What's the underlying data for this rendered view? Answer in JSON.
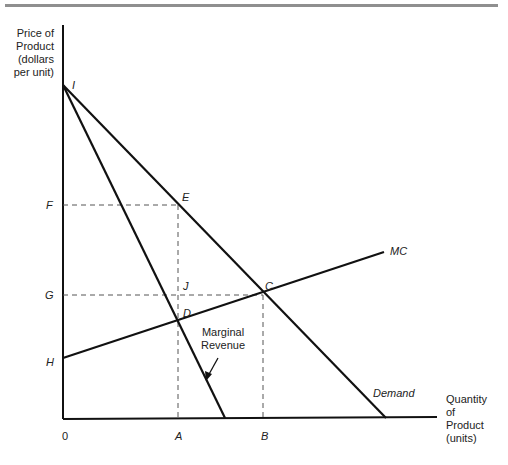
{
  "axes": {
    "y_label_lines": [
      "Price of",
      "Product",
      "(dollars",
      "per unit)"
    ],
    "x_label_lines": [
      "Quantity",
      "of",
      "Product",
      "(units)"
    ],
    "origin": "0"
  },
  "y_ticks": {
    "F": "F",
    "G": "G",
    "H": "H"
  },
  "x_ticks": {
    "A": "A",
    "B": "B"
  },
  "points": {
    "I": "I",
    "E": "E",
    "J": "J",
    "C": "C",
    "D": "D"
  },
  "curves": {
    "mc": "MC",
    "demand": "Demand",
    "mr_line1": "Marginal",
    "mr_line2": "Revenue"
  },
  "colors": {
    "line": "#111111",
    "dashed": "#555555",
    "rule": "#8f8f8f"
  }
}
